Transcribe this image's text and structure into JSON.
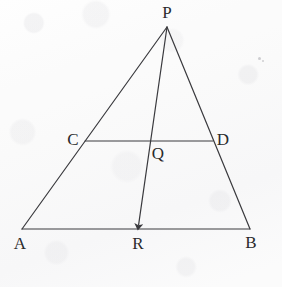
{
  "figure": {
    "kind": "geometry-diagram",
    "canvas": {
      "width": 282,
      "height": 287
    },
    "ink_color": "#3a3a3e",
    "label_color": "#2a2a2c",
    "background_color": "#fbfbfb",
    "stroke_width": 1.2
  },
  "points": {
    "P": {
      "label": "P",
      "x": 167,
      "y": 27,
      "label_x": 167,
      "label_y": 12
    },
    "A": {
      "label": "A",
      "x": 22,
      "y": 229,
      "label_x": 20,
      "label_y": 243
    },
    "B": {
      "label": "B",
      "x": 250,
      "y": 229,
      "label_x": 251,
      "label_y": 242
    },
    "C": {
      "label": "C",
      "x": 85,
      "y": 141,
      "label_x": 73,
      "label_y": 139
    },
    "D": {
      "label": "D",
      "x": 213,
      "y": 141,
      "label_x": 223,
      "label_y": 139
    },
    "Q": {
      "label": "Q",
      "x": 151,
      "y": 141,
      "label_x": 158,
      "label_y": 153
    },
    "R": {
      "label": "R",
      "x": 138,
      "y": 229,
      "label_x": 138,
      "label_y": 243
    }
  },
  "segments": [
    {
      "name": "side-AP",
      "from": "A",
      "to": "P",
      "arrow": false
    },
    {
      "name": "side-PB",
      "from": "P",
      "to": "B",
      "arrow": false
    },
    {
      "name": "base-AB",
      "from": "A",
      "to": "B",
      "arrow": false
    },
    {
      "name": "segment-CD",
      "from": "C",
      "to": "D",
      "arrow": false
    },
    {
      "name": "cevian-PR",
      "from": "P",
      "to": "R",
      "arrow": true
    }
  ],
  "specks": [
    {
      "x": 258,
      "y": 57,
      "size": 3
    },
    {
      "x": 262,
      "y": 60,
      "size": 2
    }
  ]
}
